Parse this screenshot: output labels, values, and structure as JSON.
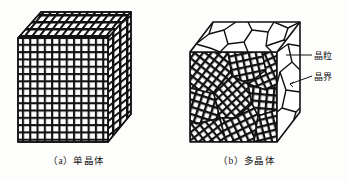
{
  "figure": {
    "background_color": "#fdfdfb",
    "ink_color": "#111111",
    "panels": [
      {
        "id": "a",
        "caption": "（a）单晶体",
        "description": "single-crystal-cube",
        "lattice": {
          "columns": 13,
          "rows": 13,
          "uniform_orientation": true
        }
      },
      {
        "id": "b",
        "caption": "（b）多晶体",
        "description": "polycrystal-cube",
        "lattice": {
          "grains": 9,
          "uniform_orientation": false
        }
      }
    ],
    "annotations": [
      {
        "id": "grain",
        "label": "晶粒",
        "leader": "horizontal"
      },
      {
        "id": "boundary",
        "label": "晶界",
        "leader": "angled"
      }
    ]
  }
}
